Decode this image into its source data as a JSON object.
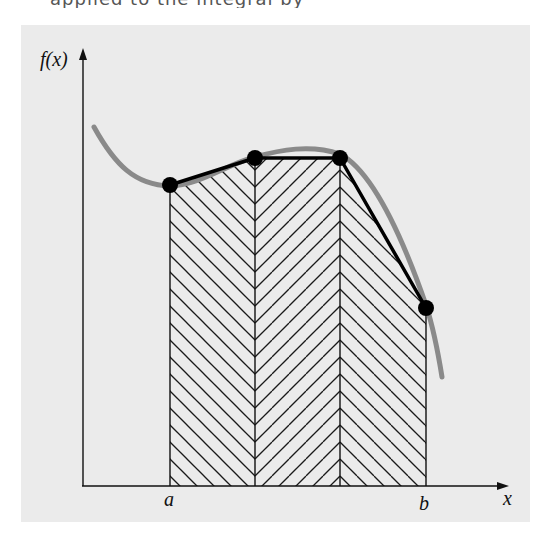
{
  "figure": {
    "top_text_fragment": "applied to the integral by",
    "y_axis_label": "f(x)",
    "x_axis_label": "x",
    "interval_start_label": "a",
    "interval_end_label": "b",
    "background_color": "#ebebeb",
    "curve_color": "#8a8a8a",
    "polyline_color": "#000000",
    "hatch_color": "#1a1a1a",
    "points": [
      {
        "x": 170,
        "y": 185
      },
      {
        "x": 255,
        "y": 158
      },
      {
        "x": 340,
        "y": 158
      },
      {
        "x": 426,
        "y": 308
      }
    ],
    "segments": [
      {
        "from": "a",
        "hatch": "backslash"
      },
      {
        "from": "x1",
        "hatch": "slash"
      },
      {
        "from": "x2",
        "hatch": "backslash"
      }
    ]
  }
}
